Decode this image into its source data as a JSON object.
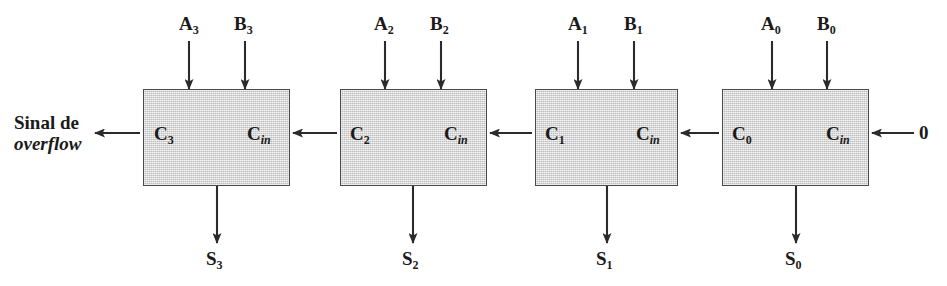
{
  "figure": {
    "overflow_label_line1": "Sinal de",
    "overflow_label_line2": "overflow",
    "carry_in_constant": "0",
    "box_fill_color": "#d4d4d4",
    "box_border_color": "#4a4a4a",
    "wire_color": "#2b2b2b"
  },
  "blocks": [
    {
      "id": "fa3",
      "name": "full-adder-bit-3",
      "input_a": "A",
      "input_a_sub": "3",
      "input_b": "B",
      "input_b_sub": "3",
      "carry_out": "C",
      "carry_out_sub": "3",
      "carry_in": "C",
      "carry_in_sub": "in",
      "sum": "S",
      "sum_sub": "3"
    },
    {
      "id": "fa2",
      "name": "full-adder-bit-2",
      "input_a": "A",
      "input_a_sub": "2",
      "input_b": "B",
      "input_b_sub": "2",
      "carry_out": "C",
      "carry_out_sub": "2",
      "carry_in": "C",
      "carry_in_sub": "in",
      "sum": "S",
      "sum_sub": "2"
    },
    {
      "id": "fa1",
      "name": "full-adder-bit-1",
      "input_a": "A",
      "input_a_sub": "1",
      "input_b": "B",
      "input_b_sub": "1",
      "carry_out": "C",
      "carry_out_sub": "1",
      "carry_in": "C",
      "carry_in_sub": "in",
      "sum": "S",
      "sum_sub": "1"
    },
    {
      "id": "fa0",
      "name": "full-adder-bit-0",
      "input_a": "A",
      "input_a_sub": "0",
      "input_b": "B",
      "input_b_sub": "0",
      "carry_out": "C",
      "carry_out_sub": "0",
      "carry_in": "C",
      "carry_in_sub": "in",
      "sum": "S",
      "sum_sub": "0"
    }
  ]
}
